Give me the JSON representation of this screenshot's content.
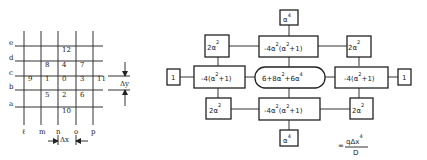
{
  "grid": {
    "row_labels": [
      "e",
      "d",
      "c",
      "b",
      "a"
    ],
    "col_labels": [
      "ℓ",
      "m",
      "n",
      "o",
      "p"
    ],
    "nodes": [
      {
        "label": "12",
        "col": 2,
        "row": 0.5
      },
      {
        "label": "8",
        "col": 1,
        "row": 1.5
      },
      {
        "label": "4",
        "col": 2,
        "row": 1.5
      },
      {
        "label": "7",
        "col": 3,
        "row": 1.5
      },
      {
        "label": "9",
        "col": 0,
        "row": 2.5
      },
      {
        "label": "1",
        "col": 1,
        "row": 2.5
      },
      {
        "label": "0",
        "col": 2,
        "row": 2.5
      },
      {
        "label": "3",
        "col": 3,
        "row": 2.5
      },
      {
        "label": "11",
        "col": 4,
        "row": 2.5
      },
      {
        "label": "5",
        "col": 1,
        "row": 3.5
      },
      {
        "label": "2",
        "col": 2,
        "row": 3.5
      },
      {
        "label": "6",
        "col": 3,
        "row": 3.5
      },
      {
        "label": "10",
        "col": 2,
        "row": 4.5
      }
    ],
    "dx_label": "Δx",
    "dy_label": "Δy"
  },
  "stencil": {
    "top": {
      "base": "α",
      "exp": "4"
    },
    "upper_left": {
      "base": "2α",
      "exp": "2"
    },
    "upper_center": {
      "pre": "-4α",
      "exp1": "2",
      "mid": "(α",
      "exp2": "2",
      "post": "+1)"
    },
    "upper_right": {
      "base": "2α",
      "exp": "2"
    },
    "far_left": {
      "text": "1"
    },
    "left": {
      "pre": "-4(α",
      "exp": "2",
      "post": "+1)"
    },
    "center": {
      "pre": "6+8α",
      "exp1": "2",
      "mid": "+6α",
      "exp2": "4"
    },
    "right": {
      "pre": "-4(α",
      "exp": "2",
      "post": "+1)"
    },
    "far_right": {
      "text": "1"
    },
    "lower_left": {
      "base": "2α",
      "exp": "2"
    },
    "lower_center": {
      "pre": "-4α",
      "exp1": "2",
      "mid": "(α",
      "exp2": "2",
      "post": "+1)"
    },
    "lower_right": {
      "base": "2α",
      "exp": "2"
    },
    "bottom": {
      "base": "α",
      "exp": "4"
    }
  },
  "formula": {
    "equals": "=",
    "numerator": "qΔx",
    "num_exp": "4",
    "denominator": "D"
  }
}
